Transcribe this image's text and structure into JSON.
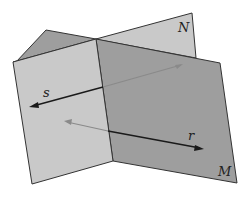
{
  "diagram": {
    "planes": [
      {
        "name": "N",
        "label": "N",
        "color": "#c9c9c9"
      },
      {
        "name": "M",
        "label": "M",
        "color": "#9e9e9e"
      }
    ],
    "lines": [
      {
        "name": "s",
        "label": "s",
        "color": "#1a1a1a"
      },
      {
        "name": "r",
        "label": "r",
        "color": "#1a1a1a"
      }
    ],
    "colors": {
      "light_face": "#c9c9c9",
      "dark_face": "#9e9e9e",
      "edge": "#333333",
      "hidden_line": "#8a8a8a"
    }
  }
}
